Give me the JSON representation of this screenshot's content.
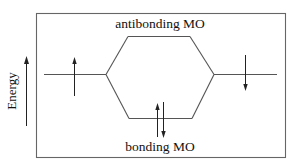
{
  "diagram": {
    "type": "molecular-orbital-energy-diagram",
    "axis": {
      "label": "Energy",
      "direction": "up"
    },
    "levels": {
      "left_atomic_orbital": {
        "electrons": [
          "up"
        ]
      },
      "right_atomic_orbital": {
        "electrons": [
          "down"
        ]
      },
      "antibonding": {
        "label": "antibonding MO",
        "electrons": []
      },
      "bonding": {
        "label": "bonding MO",
        "electrons": [
          "up",
          "down"
        ]
      }
    },
    "colors": {
      "lines": "#555555",
      "arrows": "#222222",
      "text": "#111111",
      "background": "#ffffff"
    }
  }
}
